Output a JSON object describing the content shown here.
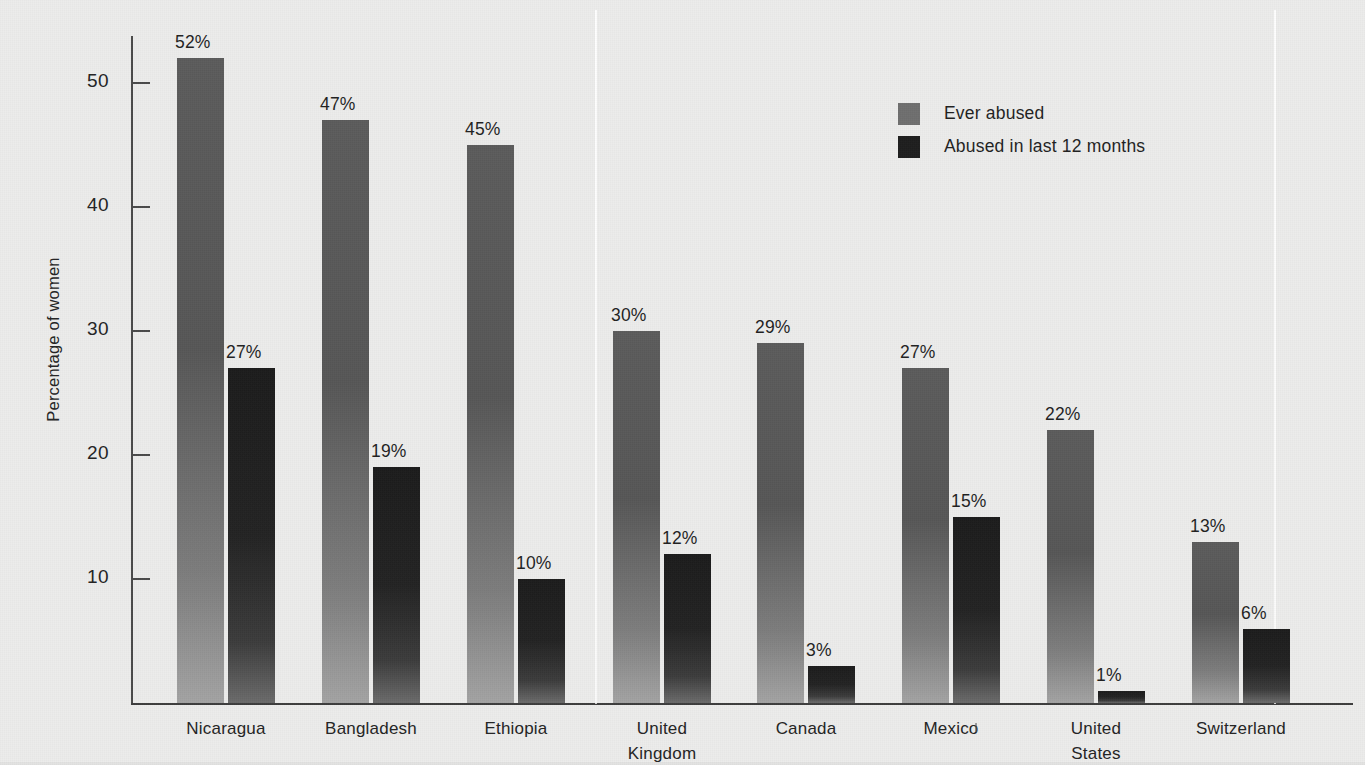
{
  "chart_data": {
    "type": "bar",
    "title": "",
    "xlabel": "",
    "ylabel": "Percentage of women",
    "ylim": [
      0,
      56
    ],
    "yticks": [
      10,
      20,
      30,
      40,
      50
    ],
    "ytick_labels": [
      "10",
      "20",
      "30",
      "40",
      "50"
    ],
    "grid": false,
    "legend_position": "top-right",
    "value_suffix": "%",
    "categories": [
      "Nicaragua",
      "Bangladesh",
      "Ethiopia",
      "United\nKingdom",
      "Canada",
      "Mexico",
      "United\nStates",
      "Switzerland"
    ],
    "series": [
      {
        "name": "Ever abused",
        "color": "#5b5b5b",
        "values": [
          52,
          47,
          45,
          30,
          29,
          27,
          22,
          13
        ],
        "labels": [
          "52%",
          "47%",
          "45%",
          "30%",
          "29%",
          "27%",
          "22%",
          "13%"
        ]
      },
      {
        "name": "Abused in last 12 months",
        "color": "#1d1d1d",
        "values": [
          27,
          19,
          10,
          12,
          3,
          15,
          1,
          6
        ],
        "labels": [
          "27%",
          "19%",
          "10%",
          "12%",
          "3%",
          "15%",
          "1%",
          "6%"
        ]
      }
    ],
    "group_separator_after_category": "Ethiopia"
  },
  "axis": {
    "y_title": "Percentage of women",
    "ticks": [
      {
        "label": "50",
        "value": 50
      },
      {
        "label": "40",
        "value": 40
      },
      {
        "label": "30",
        "value": 30
      },
      {
        "label": "20",
        "value": 20
      },
      {
        "label": "10",
        "value": 10
      }
    ]
  },
  "legend": {
    "items": [
      {
        "label": "Ever abused",
        "swatch": "light"
      },
      {
        "label": "Abused in last 12 months",
        "swatch": "dark"
      }
    ]
  },
  "categories": [
    {
      "line1": "Nicaragua",
      "line2": ""
    },
    {
      "line1": "Bangladesh",
      "line2": ""
    },
    {
      "line1": "Ethiopia",
      "line2": ""
    },
    {
      "line1": "United",
      "line2": "Kingdom"
    },
    {
      "line1": "Canada",
      "line2": ""
    },
    {
      "line1": "Mexico",
      "line2": ""
    },
    {
      "line1": "United",
      "line2": "States"
    },
    {
      "line1": "Switzerland",
      "line2": ""
    }
  ],
  "bars": [
    {
      "group": 0,
      "series": 0,
      "label": "52%"
    },
    {
      "group": 0,
      "series": 1,
      "label": "27%"
    },
    {
      "group": 1,
      "series": 0,
      "label": "47%"
    },
    {
      "group": 1,
      "series": 1,
      "label": "19%"
    },
    {
      "group": 2,
      "series": 0,
      "label": "45%"
    },
    {
      "group": 2,
      "series": 1,
      "label": "10%"
    },
    {
      "group": 3,
      "series": 0,
      "label": "30%"
    },
    {
      "group": 3,
      "series": 1,
      "label": "12%"
    },
    {
      "group": 4,
      "series": 0,
      "label": "29%"
    },
    {
      "group": 4,
      "series": 1,
      "label": "3%"
    },
    {
      "group": 5,
      "series": 0,
      "label": "27%"
    },
    {
      "group": 5,
      "series": 1,
      "label": "15%"
    },
    {
      "group": 6,
      "series": 0,
      "label": "22%"
    },
    {
      "group": 6,
      "series": 1,
      "label": "1%"
    },
    {
      "group": 7,
      "series": 0,
      "label": "13%"
    },
    {
      "group": 7,
      "series": 1,
      "label": "6%"
    }
  ],
  "colors": {
    "background": "#ececeb",
    "series_light": "#5b5b5b",
    "series_dark": "#1d1d1d",
    "axis": "#3d3d3d",
    "text": "#232323"
  }
}
